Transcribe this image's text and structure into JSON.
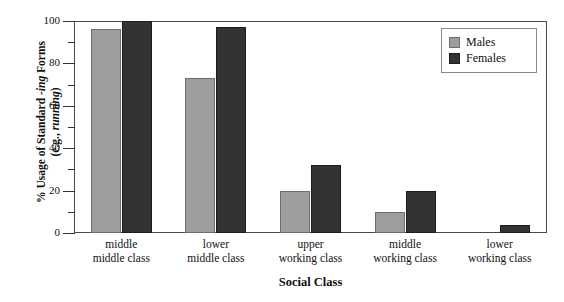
{
  "chart_data": {
    "type": "bar",
    "title": "",
    "xlabel": "Social Class",
    "ylabel": "% Usage of Standard -ing Forms (e.g., running)",
    "ylabel_line1": "% Usage of Standard -ing Forms",
    "ylabel_line2": "(e.g., running)",
    "categories": [
      "middle middle class",
      "lower middle class",
      "upper working class",
      "middle working class",
      "lower working class"
    ],
    "category_lines": [
      [
        "middle",
        "middle class"
      ],
      [
        "lower",
        "middle class"
      ],
      [
        "upper",
        "working class"
      ],
      [
        "middle",
        "working class"
      ],
      [
        "lower",
        "working class"
      ]
    ],
    "series": [
      {
        "name": "Males",
        "color": "#9d9d9d",
        "values": [
          96,
          73,
          20,
          10,
          0
        ]
      },
      {
        "name": "Females",
        "color": "#333333",
        "values": [
          100,
          97,
          32,
          20,
          4
        ]
      }
    ],
    "ylim": [
      0,
      100
    ],
    "yticks": [
      0,
      20,
      40,
      60,
      80,
      100
    ],
    "ytick_labels": [
      "0",
      "20",
      "40",
      "60",
      "80",
      "100"
    ],
    "yminor_ticks": [
      10,
      30,
      50,
      70,
      90
    ],
    "grid": false,
    "legend_position": "top-right",
    "legend_entries": [
      "Males",
      "Females"
    ]
  }
}
